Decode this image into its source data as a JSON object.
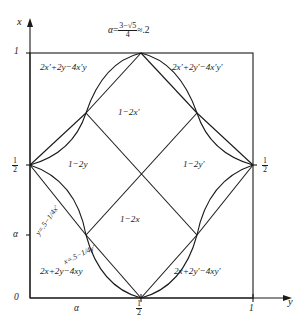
{
  "figure": {
    "type": "mathematical-region-diagram",
    "alpha_formula": {
      "symbol": "α",
      "equals": "=",
      "numerator": "3−√5",
      "denominator": "4",
      "approx": "≈.2",
      "full_text": "α=(3−√5)/4≈.2"
    },
    "axes": {
      "vertical_label": "x",
      "horizontal_label": "y",
      "y_ticks": [
        "1",
        "½",
        "α",
        "0"
      ],
      "x_ticks": [
        "0",
        "α",
        "½",
        "1"
      ],
      "right_tick": "½",
      "tick_half_num": "1",
      "tick_half_den": "2"
    },
    "regions": [
      {
        "id": "top-left",
        "label": "2x′+2y−4x′y"
      },
      {
        "id": "top-right",
        "label": "2x′+2y′−4x′y′"
      },
      {
        "id": "center-top",
        "label": "1−2x′"
      },
      {
        "id": "center-left",
        "label": "1−2y"
      },
      {
        "id": "center-right",
        "label": "1−2y′"
      },
      {
        "id": "center-bottom",
        "label": "1−2x"
      },
      {
        "id": "bottom-left",
        "label": "2x+2y−4xy"
      },
      {
        "id": "bottom-right",
        "label": "2x+2y′−4xy′"
      }
    ],
    "curve_labels": [
      {
        "id": "curve-left",
        "label": "y=.5−1/4x′"
      },
      {
        "id": "curve-bottom",
        "label": "x=.5−1/4y′"
      }
    ],
    "colors": {
      "stroke": "#1a1a1a",
      "background": "#ffffff"
    }
  }
}
